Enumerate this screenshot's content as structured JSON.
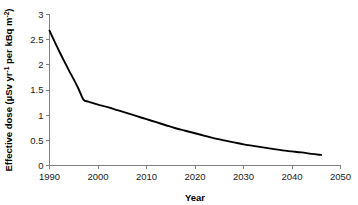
{
  "chart_data": {
    "type": "line",
    "title": "",
    "xlabel": "Year",
    "ylabel": "Effective dose (µSv yr⁻¹ per kBq m⁻²)",
    "ylabel_parts": {
      "prefix": "Effective dose (µSv yr",
      "sup1": "-1",
      "middle": " per kBq m",
      "sup2": "-2",
      "suffix": ")"
    },
    "xlim": [
      1990,
      2050
    ],
    "ylim": [
      0,
      3
    ],
    "xticks": [
      1990,
      2000,
      2010,
      2020,
      2030,
      2040,
      2050
    ],
    "xtick_labels": [
      "1990",
      "2000",
      "2010",
      "2020",
      "2030",
      "2040",
      "2050"
    ],
    "yticks": [
      0,
      0.5,
      1,
      1.5,
      2,
      2.5,
      3
    ],
    "ytick_labels": [
      "0",
      "0.5",
      "1",
      "1.5",
      "2",
      "2.5",
      "3"
    ],
    "grid": false,
    "legend": false,
    "series": [
      {
        "name": "Effective dose",
        "color": "#000000",
        "x": [
          1990,
          1991,
          1992,
          1993,
          1994,
          1995,
          1996,
          1997,
          1998,
          1999,
          2000,
          2002,
          2004,
          2006,
          2008,
          2010,
          2012,
          2014,
          2016,
          2018,
          2020,
          2022,
          2024,
          2026,
          2028,
          2030,
          2032,
          2034,
          2036,
          2038,
          2040,
          2042,
          2044,
          2046
        ],
        "values": [
          2.68,
          2.47,
          2.27,
          2.08,
          1.89,
          1.71,
          1.52,
          1.31,
          1.27,
          1.24,
          1.21,
          1.16,
          1.1,
          1.04,
          0.98,
          0.92,
          0.86,
          0.8,
          0.74,
          0.69,
          0.64,
          0.59,
          0.54,
          0.5,
          0.46,
          0.42,
          0.39,
          0.36,
          0.33,
          0.3,
          0.28,
          0.26,
          0.23,
          0.21
        ]
      }
    ],
    "annotations": []
  },
  "axes": {
    "x_axis_name": "year-axis",
    "y_axis_name": "effective-dose-axis"
  }
}
